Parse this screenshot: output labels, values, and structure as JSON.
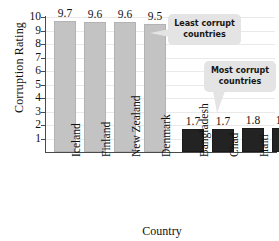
{
  "chart_data": {
    "type": "bar",
    "title": "",
    "xlabel": "Country",
    "ylabel": "Corruption Rating",
    "categories": [
      "Iceland",
      "Finland",
      "New Zealand",
      "Denmark",
      "Bangladesh",
      "Chad",
      "Haiti",
      "Myanmar"
    ],
    "values": [
      9.7,
      9.6,
      9.6,
      9.5,
      1.7,
      1.7,
      1.8,
      1.8
    ],
    "value_labels": [
      "9.7",
      "9.6",
      "9.6",
      "9.5",
      "1.7",
      "1.7",
      "1.8",
      "1.8"
    ],
    "bar_colors": [
      "#c3c3c3",
      "#c3c3c3",
      "#c3c3c3",
      "#c3c3c3",
      "#232323",
      "#232323",
      "#232323",
      "#232323"
    ],
    "ylim": [
      0,
      10
    ],
    "yticks": [
      10,
      9,
      8,
      7,
      6,
      5,
      4,
      3,
      2,
      1
    ],
    "ytick_labels": [
      "10",
      "9",
      "8",
      "7",
      "6",
      "5",
      "4",
      "3",
      "2",
      "1"
    ],
    "grid": true,
    "legend": "none",
    "annotations": [
      {
        "text_line1": "Least corrupt",
        "text_line2": "countries",
        "points_to": "light-gray-bars"
      },
      {
        "text_line1": "Most corrupt",
        "text_line2": "countries",
        "points_to": "dark-bars"
      }
    ],
    "colors": {
      "light_bar": "#c3c3c3",
      "dark_bar": "#232323",
      "callout_bg": "#e4e4e4",
      "axis": "#4a4a4a",
      "grid": "#e9e9e9"
    }
  }
}
